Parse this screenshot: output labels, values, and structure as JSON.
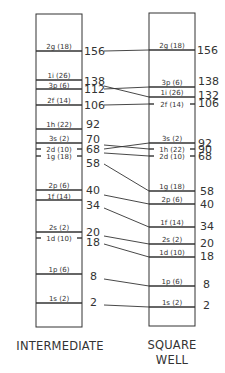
{
  "colors": {
    "line": "#333333",
    "text": "#333333",
    "background": "#ffffff"
  },
  "columns": {
    "left": {
      "title": "INTERMEDIATE"
    },
    "right": {
      "title_line1": "SQUARE",
      "title_line2": "WELL"
    }
  },
  "levels": [
    {
      "id": "2g",
      "label": "2g (18)",
      "left_y": 51,
      "right_y": 50
    },
    {
      "id": "1i",
      "label": "1i (26)",
      "left_y": 80,
      "right_y": 97
    },
    {
      "id": "3p",
      "label": "3p (6)",
      "left_y": 89,
      "right_y": 87
    },
    {
      "id": "2f",
      "label": "2f (14)",
      "left_y": 105,
      "right_y": 104
    },
    {
      "id": "1h",
      "label": "1h (22)",
      "left_y": 129,
      "right_y": 149
    },
    {
      "id": "3s",
      "label": "3s (2)",
      "left_y": 143,
      "right_y": 143
    },
    {
      "id": "2d",
      "label": "2d (10)",
      "left_y": 149,
      "right_y": 156
    },
    {
      "id": "1g",
      "label": "1g (18)",
      "left_y": 156,
      "right_y": 191
    },
    {
      "id": "2p",
      "label": "2p (6)",
      "left_y": 190,
      "right_y": 204
    },
    {
      "id": "1f",
      "label": "1f (14)",
      "left_y": 200,
      "right_y": 227
    },
    {
      "id": "2s",
      "label": "2s (2)",
      "left_y": 232,
      "right_y": 244
    },
    {
      "id": "1d",
      "label": "1d (10)",
      "left_y": 238,
      "right_y": 257
    },
    {
      "id": "1p",
      "label": "1p (6)",
      "left_y": 274,
      "right_y": 286
    },
    {
      "id": "1s",
      "label": "1s (2)",
      "left_y": 303,
      "right_y": 307
    }
  ],
  "magic_numbers": {
    "left": [
      "156",
      "138",
      "112",
      "106",
      "92",
      "70",
      "68",
      "58",
      "40",
      "34",
      "20",
      "18",
      "8",
      "2"
    ],
    "right": [
      "156",
      "138",
      "132",
      "106",
      "92",
      "90",
      "68",
      "58",
      "40",
      "34",
      "20",
      "18",
      "8",
      "2"
    ]
  }
}
